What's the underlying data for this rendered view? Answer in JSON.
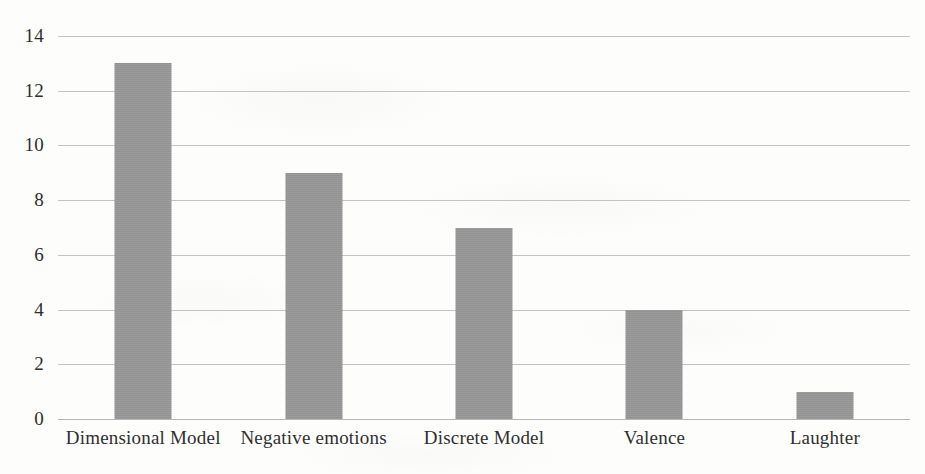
{
  "chart_data": {
    "type": "bar",
    "title": "",
    "subtitle": "",
    "xlabel": "",
    "ylabel": "",
    "categories": [
      "Dimensional Model",
      "Negative emotions",
      "Discrete Model",
      "Valence",
      "Laughter"
    ],
    "values": [
      13,
      9,
      7,
      4,
      1
    ],
    "series": [
      {
        "name": "",
        "values": [
          13,
          9,
          7,
          4,
          1
        ]
      }
    ],
    "ylim": [
      0,
      14
    ],
    "yticks": [
      0,
      2,
      4,
      6,
      8,
      10,
      12,
      14
    ],
    "ytick_labels": [
      "0",
      "2",
      "4",
      "6",
      "8",
      "10",
      "12",
      "14"
    ],
    "grid": true,
    "grid_axis": "y",
    "legend": false,
    "legend_position": "none",
    "bar_color": "#979797",
    "gridline_color": "#b9b9b9",
    "axis_text_color": "#2e2e2e",
    "background_color": "#fdfdfc"
  },
  "axis": {
    "y": {
      "ticks": [
        {
          "label": "14",
          "value": 14
        },
        {
          "label": "12",
          "value": 12
        },
        {
          "label": "10",
          "value": 10
        },
        {
          "label": "8",
          "value": 8
        },
        {
          "label": "6",
          "value": 6
        },
        {
          "label": "4",
          "value": 4
        },
        {
          "label": "2",
          "value": 2
        },
        {
          "label": "0",
          "value": 0
        }
      ]
    },
    "x": {
      "ticks": [
        {
          "label": "Dimensional Model"
        },
        {
          "label": "Negative emotions"
        },
        {
          "label": "Discrete Model"
        },
        {
          "label": "Valence"
        },
        {
          "label": "Laughter"
        }
      ]
    }
  }
}
